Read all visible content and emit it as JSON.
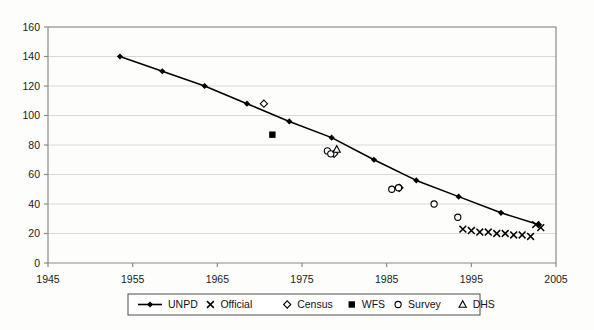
{
  "chart_data": {
    "type": "scatter",
    "title": "",
    "xlabel": "",
    "ylabel": "",
    "xlim": [
      1945,
      2005
    ],
    "ylim": [
      0,
      160
    ],
    "xticks": [
      1945,
      1955,
      1965,
      1975,
      1985,
      1995,
      2005
    ],
    "yticks": [
      0,
      20,
      40,
      60,
      80,
      100,
      120,
      140,
      160
    ],
    "grid": "horizontal",
    "legend_position": "bottom",
    "series": [
      {
        "name": "UNPD",
        "marker": "filled-diamond-line",
        "x": [
          1953.5,
          1958.5,
          1963.5,
          1968.5,
          1973.5,
          1978.5,
          1983.5,
          1988.5,
          1993.5,
          1998.5,
          2003.0
        ],
        "values": [
          140,
          130,
          120,
          108,
          96,
          85,
          70,
          56,
          45,
          34,
          26
        ]
      },
      {
        "name": "Official",
        "marker": "cross",
        "x": [
          1994.0,
          1995.0,
          1996.0,
          1997.0,
          1998.0,
          1999.0,
          2000.0,
          2001.0,
          2002.0,
          2002.6,
          2003.2
        ],
        "values": [
          23,
          22,
          21,
          21,
          20,
          20,
          19,
          19,
          18,
          26,
          24
        ]
      },
      {
        "name": "Census",
        "marker": "open-diamond",
        "x": [
          1970.5,
          1978.8,
          1986.5
        ],
        "values": [
          108,
          74,
          51
        ]
      },
      {
        "name": "WFS",
        "marker": "filled-square",
        "x": [
          1971.5
        ],
        "values": [
          87
        ]
      },
      {
        "name": "Survey",
        "marker": "open-circle",
        "x": [
          1978.0,
          1978.4,
          1985.6,
          1986.4,
          1990.6,
          1993.4
        ],
        "values": [
          76,
          74,
          50,
          51,
          40,
          31
        ]
      },
      {
        "name": "DHS",
        "marker": "open-triangle",
        "x": [
          1979.1
        ],
        "values": [
          77
        ]
      }
    ],
    "legend_items": [
      {
        "label": "UNPD",
        "marker": "filled-diamond-line"
      },
      {
        "label": "Official",
        "marker": "cross"
      },
      {
        "label": "Census",
        "marker": "open-diamond"
      },
      {
        "label": "WFS",
        "marker": "filled-square"
      },
      {
        "label": "Survey",
        "marker": "open-circle"
      },
      {
        "label": "DHS",
        "marker": "open-triangle"
      }
    ]
  }
}
